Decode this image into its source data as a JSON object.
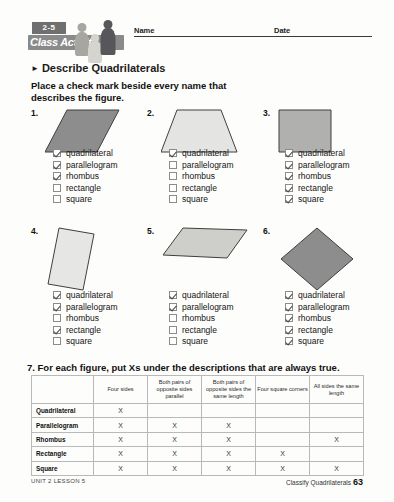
{
  "header": {
    "lesson_badge": "2-5",
    "logo_text": "Class Activity",
    "name_label": "Name",
    "date_label": "Date"
  },
  "section": {
    "heading": "Describe Quadrilaterals",
    "arrow_icon": "triangle-right-icon",
    "instructions": "Place a check mark beside every name that describes the figure."
  },
  "option_labels": [
    "quadrilateral",
    "parallelogram",
    "rhombus",
    "rectangle",
    "square"
  ],
  "problems": [
    {
      "number": "1.",
      "shape_name": "parallelogram",
      "fill": "#8d8d8d",
      "stroke": "#3f3f3f",
      "points": "22,2 74,2 52,44 0,44",
      "checks": [
        true,
        true,
        true,
        false,
        false
      ]
    },
    {
      "number": "2.",
      "shape_name": "trapezoid",
      "fill": "#e4e4e2",
      "stroke": "#3f3f3f",
      "points": "16,2 60,2 76,44 0,44",
      "checks": [
        true,
        false,
        false,
        false,
        false
      ]
    },
    {
      "number": "3.",
      "shape_name": "square",
      "fill": "#b0b0ae",
      "stroke": "#3f3f3f",
      "points": "2,2 54,2 54,44 2,44",
      "checks": [
        true,
        true,
        true,
        true,
        true
      ]
    },
    {
      "number": "4.",
      "shape_name": "tilted-rectangle",
      "fill": "#e6e6e4",
      "stroke": "#3f3f3f",
      "points": "14,2 49,8 38,64 3,58",
      "checks": [
        true,
        true,
        false,
        true,
        false
      ]
    },
    {
      "number": "5.",
      "shape_name": "slanted-parallelogram",
      "fill": "#cececb",
      "stroke": "#3f3f3f",
      "points": "22,2 86,4 66,32 2,29",
      "checks": [
        true,
        true,
        false,
        false,
        false
      ]
    },
    {
      "number": "6.",
      "shape_name": "rotated-square-diamond",
      "fill": "#8d8d8d",
      "stroke": "#3f3f3f",
      "points": "40,2 76,33 40,64 4,33",
      "checks": [
        true,
        true,
        true,
        true,
        true
      ]
    }
  ],
  "question7": {
    "prompt": "7. For each figure, put Xs under the descriptions that are always true.",
    "mark": "X",
    "columns": [
      "",
      "Four sides",
      "Both pairs of opposite sides parallel",
      "Both pairs of opposite sides the same length",
      "Four square corners",
      "All sides the same length"
    ],
    "rows": [
      {
        "label": "Quadrilateral",
        "marks": [
          true,
          false,
          false,
          false,
          false
        ]
      },
      {
        "label": "Parallelogram",
        "marks": [
          true,
          true,
          true,
          false,
          false
        ]
      },
      {
        "label": "Rhombus",
        "marks": [
          true,
          true,
          true,
          false,
          true
        ]
      },
      {
        "label": "Rectangle",
        "marks": [
          true,
          true,
          true,
          true,
          false
        ]
      },
      {
        "label": "Square",
        "marks": [
          true,
          true,
          true,
          true,
          true
        ]
      }
    ]
  },
  "footer": {
    "left": "UNIT 2 LESSON 5",
    "right_title": "Classify Quadrilaterals",
    "page_number": "63"
  }
}
